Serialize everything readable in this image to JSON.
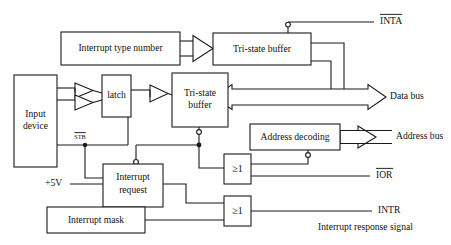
{
  "diagram": {
    "type": "block-diagram",
    "colors": {
      "line": "#1a1a1a",
      "text": "#111111",
      "background": "#ffffff"
    },
    "blocks": [
      {
        "id": "interrupt-type-number",
        "label": "Interrupt type number"
      },
      {
        "id": "tri-state-buffer-top",
        "label_line1": "Tri-state buffer"
      },
      {
        "id": "input-device",
        "label_line1": "Input",
        "label_line2": "device"
      },
      {
        "id": "latch",
        "label": "latch"
      },
      {
        "id": "tri-state-buffer-main",
        "label_line1": "Tri-state",
        "label_line2": "buffer"
      },
      {
        "id": "address-decoding",
        "label": "Address decoding"
      },
      {
        "id": "interrupt-request",
        "label_line1": "Interrupt",
        "label_line2": "request"
      },
      {
        "id": "interrupt-mask",
        "label": "Interrupt mask"
      },
      {
        "id": "or-gate-ior",
        "label": "≥1"
      },
      {
        "id": "or-gate-intr",
        "label": "≥1"
      }
    ],
    "signals": [
      {
        "id": "inta",
        "label": "INTA",
        "overline": true
      },
      {
        "id": "ior",
        "label": "IOR",
        "overline": true
      },
      {
        "id": "intr",
        "label": "INTR",
        "overline": false
      },
      {
        "id": "stb",
        "label": "STB",
        "overline": true
      },
      {
        "id": "vcc",
        "label": "+5V",
        "overline": false
      }
    ],
    "buses": [
      {
        "id": "data-bus",
        "label": "Data bus",
        "direction": "bidirectional"
      },
      {
        "id": "address-bus",
        "label": "Address bus",
        "direction": "input"
      }
    ],
    "notes": [
      {
        "id": "interrupt-response-signal",
        "label": "Interrupt response signal"
      }
    ]
  }
}
